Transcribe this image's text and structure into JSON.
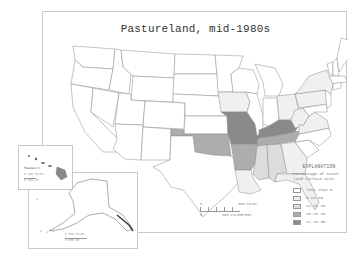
{
  "map": {
    "title": "Pastureland, mid-1980s",
    "legend": {
      "heading": "EXPLANATION",
      "subtitle": "Percentage of state land surface area",
      "classes": [
        {
          "label": "less than 5",
          "color": "#ffffff"
        },
        {
          "label": "5 to 10",
          "color": "#f0f0f0"
        },
        {
          "label": "11 to 15",
          "color": "#dcdcdc"
        },
        {
          "label": "16 to 20",
          "color": "#adadad"
        },
        {
          "label": "21 to 30",
          "color": "#8a8a8a"
        }
      ]
    },
    "scale_bar": {
      "miles_zero": "0",
      "miles_label": "500 MILES",
      "km_zero": "0",
      "km_label": "500 KILOMETERS"
    },
    "state_classes": {
      "21 to 30": [
        "Missouri",
        "Kentucky"
      ],
      "16 to 20": [
        "Tennessee",
        "Arkansas",
        "Oklahoma"
      ],
      "11 to 15": [
        "Mississippi",
        "Alabama"
      ],
      "5 to 10": [
        "Iowa",
        "Ohio",
        "West Virginia",
        "Virginia",
        "Pennsylvania",
        "New York",
        "Georgia",
        "Florida",
        "Louisiana"
      ]
    },
    "insets": {
      "hawaii": {
        "label": "HAWAII",
        "scale_miles": "0   100 MILES",
        "scale_km": "0   100 KM"
      },
      "alaska": {
        "label": "ALASKA",
        "scale_miles": "0   500 MILES",
        "scale_km": "0   500 KM"
      }
    }
  }
}
